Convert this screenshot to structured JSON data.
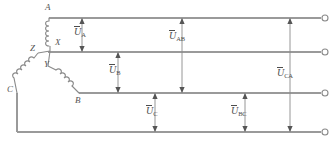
{
  "figure": {
    "type": "three-phase-star-wye-source-schematic",
    "stroke_color": "#8a8a8a",
    "label_color": "#4d4d4d",
    "background": "#ffffff"
  },
  "nodes": [
    {
      "id": "A",
      "label": "A",
      "x": 49,
      "y": 18,
      "label_x": 45,
      "label_y": 3
    },
    {
      "id": "X",
      "label": "X",
      "x": 49,
      "y": 46,
      "label_x": 55,
      "label_y": 39
    },
    {
      "id": "Z",
      "label": "Z",
      "x": 48,
      "y": 52,
      "label_x": 31,
      "label_y": 45
    },
    {
      "id": "Y",
      "label": "Y",
      "x": 48,
      "y": 68,
      "label_x": 44,
      "label_y": 61
    },
    {
      "id": "B",
      "label": "B",
      "x": 79,
      "y": 93,
      "label_x": 75,
      "label_y": 96
    },
    {
      "id": "C",
      "label": "C",
      "x": 17,
      "y": 93,
      "label_x": 8,
      "label_y": 85
    }
  ],
  "bus_lines": [
    {
      "name": "line-a",
      "y": 18,
      "x1": 49,
      "x2": 321
    },
    {
      "name": "line-x-z",
      "y": 52,
      "x1": 48,
      "x2": 321
    },
    {
      "name": "line-b",
      "y": 93,
      "x1": 79,
      "x2": 321
    },
    {
      "name": "line-c",
      "y": 132,
      "x1": 17,
      "x2": 321
    }
  ],
  "terminals": [
    {
      "name": "terminal-a",
      "x": 325,
      "y": 18,
      "r": 3
    },
    {
      "name": "terminal-x",
      "x": 325,
      "y": 52,
      "r": 3
    },
    {
      "name": "terminal-b",
      "x": 325,
      "y": 93,
      "r": 3
    },
    {
      "name": "terminal-c",
      "x": 325,
      "y": 132,
      "r": 3
    }
  ],
  "voltage_arrows": [
    {
      "name": "u-a",
      "text": "U",
      "sub": "A",
      "x": 82,
      "y_top": 19,
      "y_bottom": 51,
      "label_x": 75,
      "label_y": 28,
      "double": true
    },
    {
      "name": "u-b",
      "text": "U",
      "sub": "B",
      "x": 118,
      "y_top": 53,
      "y_bottom": 92,
      "label_x": 110,
      "label_y": 66,
      "double": true
    },
    {
      "name": "u-c",
      "text": "U",
      "sub": "C",
      "x": 155,
      "y_top": 94,
      "y_bottom": 131,
      "label_x": 147,
      "label_y": 107,
      "double": true
    },
    {
      "name": "u-ab",
      "text": "U",
      "sub": "AB",
      "x": 182,
      "y_top": 19,
      "y_bottom": 92,
      "label_x": 170,
      "label_y": 32,
      "double": true
    },
    {
      "name": "u-bc",
      "text": "U",
      "sub": "BC",
      "x": 245,
      "y_top": 94,
      "y_bottom": 131,
      "label_x": 232,
      "label_y": 107,
      "double": true
    },
    {
      "name": "u-ca",
      "text": "U",
      "sub": "CA",
      "x": 290,
      "y_top": 19,
      "y_bottom": 131,
      "label_x": 278,
      "label_y": 69,
      "double": true
    }
  ],
  "windings": [
    {
      "name": "coil-a-x",
      "from": "A",
      "to": "X"
    },
    {
      "name": "coil-z-c",
      "from": "Z",
      "to": "C"
    },
    {
      "name": "coil-y-b",
      "from": "Y",
      "to": "B"
    }
  ]
}
